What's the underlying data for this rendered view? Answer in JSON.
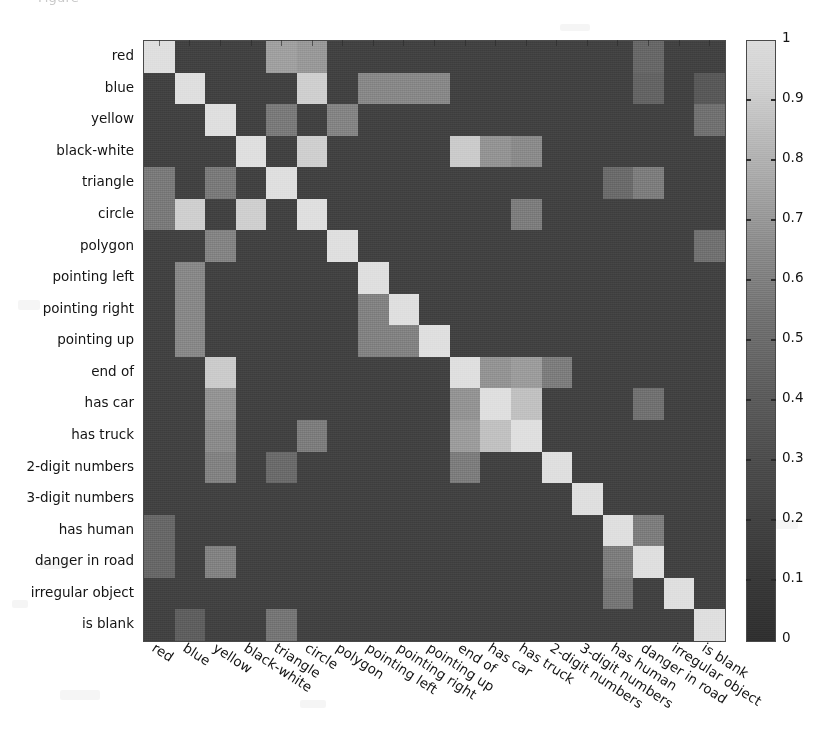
{
  "caption": {
    "text": "Figure"
  },
  "figure": {
    "title": "",
    "axis_label_color": "#141414"
  },
  "colorbar": {
    "min": 0,
    "max": 1,
    "orientation": "vertical",
    "colormap": "grayscale",
    "low_color": "#2f2f2f",
    "high_color": "#dcdcdc",
    "ticks": [
      {
        "value": 1,
        "label": "1"
      },
      {
        "value": 0.9,
        "label": "0.9"
      },
      {
        "value": 0.8,
        "label": "0.8"
      },
      {
        "value": 0.7,
        "label": "0.7"
      },
      {
        "value": 0.6,
        "label": "0.6"
      },
      {
        "value": 0.5,
        "label": "0.5"
      },
      {
        "value": 0.4,
        "label": "0.4"
      },
      {
        "value": 0.3,
        "label": "0.3"
      },
      {
        "value": 0.2,
        "label": "0.2"
      },
      {
        "value": 0.1,
        "label": "0.1"
      },
      {
        "value": 0,
        "label": "0"
      }
    ]
  },
  "chart_data": {
    "type": "heatmap",
    "title": "",
    "xlabel": "",
    "ylabel": "",
    "grid": false,
    "legend_position": "right",
    "zlim": [
      0,
      1
    ],
    "colormap": "gray",
    "categories": [
      "red",
      "blue",
      "yellow",
      "black-white",
      "triangle",
      "circle",
      "polygon",
      "pointing left",
      "pointing right",
      "pointing up",
      "end of",
      "has car",
      "has truck",
      "2-digit numbers",
      "3-digit numbers",
      "has human",
      "danger in road",
      "irregular object",
      "is blank"
    ],
    "x_tick_labels": [
      "red",
      "blue",
      "yellow",
      "black-white",
      "triangle",
      "circle",
      "polygon",
      "pointing left",
      "pointing right",
      "pointing up",
      "end of",
      "has car",
      "has truck",
      "2-digit numbers",
      "3-digit numbers",
      "has human",
      "danger in road",
      "irregular object",
      "is blank"
    ],
    "y_tick_labels": [
      "red",
      "blue",
      "yellow",
      "black-white",
      "triangle",
      "circle",
      "polygon",
      "pointing left",
      "pointing right",
      "pointing up",
      "end of",
      "has car",
      "has truck",
      "2-digit numbers",
      "3-digit numbers",
      "has human",
      "danger in road",
      "irregular object",
      "is blank"
    ],
    "values": [
      [
        1.0,
        0.1,
        0.1,
        0.1,
        0.62,
        0.58,
        0.1,
        0.1,
        0.1,
        0.1,
        0.1,
        0.1,
        0.1,
        0.1,
        0.1,
        0.1,
        0.3,
        0.1,
        0.1
      ],
      [
        0.1,
        1.0,
        0.1,
        0.1,
        0.1,
        0.9,
        0.1,
        0.48,
        0.48,
        0.48,
        0.1,
        0.1,
        0.1,
        0.1,
        0.1,
        0.1,
        0.28,
        0.1,
        0.22
      ],
      [
        0.1,
        0.1,
        1.0,
        0.1,
        0.4,
        0.1,
        0.46,
        0.1,
        0.1,
        0.1,
        0.1,
        0.1,
        0.1,
        0.1,
        0.1,
        0.1,
        0.1,
        0.1,
        0.35
      ],
      [
        0.1,
        0.1,
        0.1,
        1.0,
        0.1,
        0.9,
        0.1,
        0.1,
        0.1,
        0.1,
        0.88,
        0.55,
        0.5,
        0.1,
        0.1,
        0.1,
        0.1,
        0.1,
        0.1
      ],
      [
        0.4,
        0.1,
        0.4,
        0.1,
        1.0,
        0.1,
        0.1,
        0.1,
        0.1,
        0.1,
        0.1,
        0.1,
        0.1,
        0.1,
        0.1,
        0.32,
        0.42,
        0.1,
        0.1
      ],
      [
        0.4,
        0.9,
        0.1,
        0.9,
        0.1,
        1.0,
        0.1,
        0.1,
        0.1,
        0.1,
        0.1,
        0.1,
        0.42,
        0.1,
        0.1,
        0.1,
        0.1,
        0.1,
        0.1
      ],
      [
        0.1,
        0.1,
        0.46,
        0.1,
        0.1,
        0.1,
        1.0,
        0.1,
        0.1,
        0.1,
        0.1,
        0.1,
        0.1,
        0.1,
        0.1,
        0.1,
        0.1,
        0.1,
        0.35
      ],
      [
        0.1,
        0.48,
        0.1,
        0.1,
        0.1,
        0.1,
        0.1,
        1.0,
        0.1,
        0.1,
        0.1,
        0.1,
        0.1,
        0.1,
        0.1,
        0.1,
        0.1,
        0.1,
        0.1
      ],
      [
        0.1,
        0.48,
        0.1,
        0.1,
        0.1,
        0.1,
        0.1,
        0.45,
        1.0,
        0.1,
        0.1,
        0.1,
        0.1,
        0.1,
        0.1,
        0.1,
        0.1,
        0.1,
        0.1
      ],
      [
        0.1,
        0.48,
        0.1,
        0.1,
        0.1,
        0.1,
        0.1,
        0.45,
        0.45,
        1.0,
        0.1,
        0.1,
        0.1,
        0.1,
        0.1,
        0.1,
        0.1,
        0.1,
        0.1
      ],
      [
        0.1,
        0.1,
        0.88,
        0.1,
        0.1,
        0.1,
        0.1,
        0.1,
        0.1,
        0.1,
        1.0,
        0.55,
        0.6,
        0.42,
        0.1,
        0.1,
        0.1,
        0.1,
        0.1
      ],
      [
        0.1,
        0.1,
        0.55,
        0.1,
        0.1,
        0.1,
        0.1,
        0.1,
        0.1,
        0.1,
        0.55,
        1.0,
        0.82,
        0.1,
        0.1,
        0.1,
        0.35,
        0.1,
        0.1
      ],
      [
        0.1,
        0.1,
        0.5,
        0.1,
        0.1,
        0.42,
        0.1,
        0.1,
        0.1,
        0.1,
        0.6,
        0.82,
        1.0,
        0.1,
        0.1,
        0.1,
        0.1,
        0.1,
        0.1
      ],
      [
        0.1,
        0.1,
        0.45,
        0.1,
        0.32,
        0.1,
        0.1,
        0.1,
        0.1,
        0.1,
        0.42,
        0.1,
        0.1,
        1.0,
        0.1,
        0.1,
        0.1,
        0.1,
        0.1
      ],
      [
        0.1,
        0.1,
        0.1,
        0.1,
        0.1,
        0.1,
        0.1,
        0.1,
        0.1,
        0.1,
        0.1,
        0.1,
        0.1,
        0.1,
        1.0,
        0.1,
        0.1,
        0.1,
        0.1
      ],
      [
        0.3,
        0.1,
        0.1,
        0.1,
        0.1,
        0.1,
        0.1,
        0.1,
        0.1,
        0.1,
        0.1,
        0.1,
        0.1,
        0.1,
        0.1,
        1.0,
        0.42,
        0.1,
        0.1
      ],
      [
        0.3,
        0.1,
        0.45,
        0.1,
        0.1,
        0.1,
        0.1,
        0.1,
        0.1,
        0.1,
        0.1,
        0.1,
        0.1,
        0.1,
        0.1,
        0.42,
        1.0,
        0.1,
        0.1
      ],
      [
        0.1,
        0.1,
        0.1,
        0.1,
        0.1,
        0.1,
        0.1,
        0.1,
        0.1,
        0.1,
        0.1,
        0.1,
        0.1,
        0.1,
        0.1,
        0.38,
        0.1,
        1.0,
        0.1
      ],
      [
        0.1,
        0.25,
        0.1,
        0.1,
        0.38,
        0.1,
        0.1,
        0.1,
        0.1,
        0.1,
        0.1,
        0.1,
        0.1,
        0.1,
        0.1,
        0.1,
        0.1,
        0.1,
        1.0
      ]
    ]
  }
}
